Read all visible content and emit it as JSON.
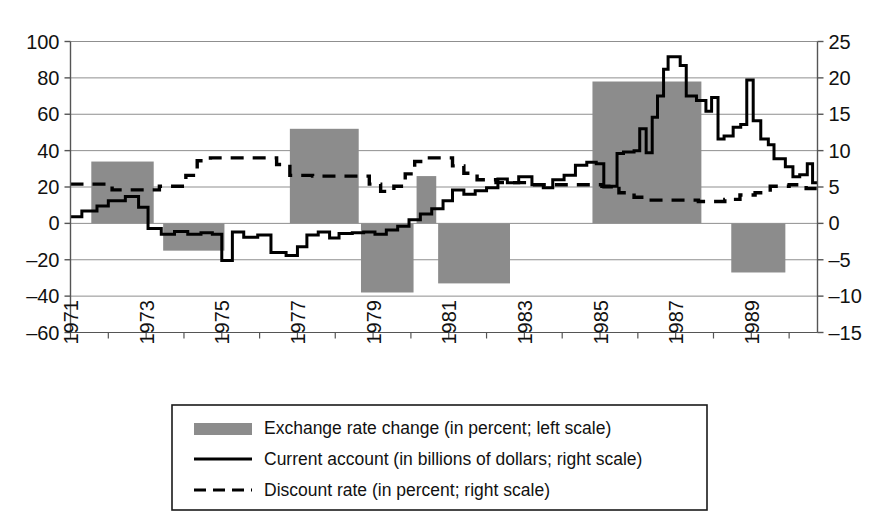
{
  "chart_data": {
    "type": "bar",
    "title": "",
    "xlabel": "",
    "ylabel_left": "",
    "ylabel_right": "",
    "grid": true,
    "legend_position": "bottom",
    "x_range": [
      1971,
      1990.75
    ],
    "x_tick_labels": [
      "1971",
      "1973",
      "1975",
      "1977",
      "1979",
      "1981",
      "1983",
      "1985",
      "1987",
      "1989"
    ],
    "x_tick_values": [
      1971,
      1973,
      1975,
      1977,
      1979,
      1981,
      1983,
      1985,
      1987,
      1989
    ],
    "left_axis": {
      "label": "percent",
      "ylim": [
        -60,
        100
      ],
      "ticks": [
        -60,
        -40,
        -20,
        0,
        20,
        40,
        60,
        80,
        100
      ],
      "tick_labels": [
        "–60",
        "–40",
        "–20",
        "0",
        "20",
        "40",
        "60",
        "80",
        "100"
      ]
    },
    "right_axis": {
      "label": "billions of dollars / percent",
      "ylim": [
        -15,
        25
      ],
      "ticks": [
        -15,
        -10,
        -5,
        0,
        5,
        10,
        15,
        20,
        25
      ],
      "tick_labels": [
        "–15",
        "–10",
        "–5",
        "0",
        "5",
        "10",
        "15",
        "20",
        "25"
      ]
    },
    "series": [
      {
        "name": "Exchange rate change (in percent; left scale)",
        "type": "bar",
        "axis": "left",
        "color": "#8c8c8c",
        "bars": [
          {
            "x_start": 1971.55,
            "x_end": 1973.2,
            "value": 34
          },
          {
            "x_start": 1973.45,
            "x_end": 1975.07,
            "value": -15
          },
          {
            "x_start": 1976.8,
            "x_end": 1978.62,
            "value": 52
          },
          {
            "x_start": 1978.68,
            "x_end": 1980.07,
            "value": -38
          },
          {
            "x_start": 1980.15,
            "x_end": 1980.67,
            "value": 26
          },
          {
            "x_start": 1980.72,
            "x_end": 1982.62,
            "value": -33
          },
          {
            "x_start": 1984.8,
            "x_end": 1987.68,
            "value": 78
          },
          {
            "x_start": 1988.47,
            "x_end": 1989.9,
            "value": -27
          }
        ]
      },
      {
        "name": "Current account (in billions of dollars; right scale)",
        "type": "line",
        "axis": "right",
        "style": "solid",
        "color": "#000000",
        "points": [
          [
            1971.0,
            0.9
          ],
          [
            1971.3,
            0.9
          ],
          [
            1971.3,
            1.7
          ],
          [
            1971.7,
            1.7
          ],
          [
            1971.7,
            2.4
          ],
          [
            1972.0,
            2.4
          ],
          [
            1972.0,
            3.1
          ],
          [
            1972.45,
            3.1
          ],
          [
            1972.45,
            3.7
          ],
          [
            1972.8,
            3.7
          ],
          [
            1972.8,
            2.2
          ],
          [
            1973.05,
            2.2
          ],
          [
            1973.05,
            -0.7
          ],
          [
            1973.4,
            -0.7
          ],
          [
            1973.4,
            -1.5
          ],
          [
            1973.75,
            -1.5
          ],
          [
            1973.75,
            -1.1
          ],
          [
            1974.1,
            -1.1
          ],
          [
            1974.1,
            -1.5
          ],
          [
            1974.45,
            -1.5
          ],
          [
            1974.45,
            -1.3
          ],
          [
            1974.75,
            -1.3
          ],
          [
            1974.75,
            -1.5
          ],
          [
            1975.0,
            -1.5
          ],
          [
            1975.0,
            -5.1
          ],
          [
            1975.28,
            -5.1
          ],
          [
            1975.28,
            -1.2
          ],
          [
            1975.58,
            -1.2
          ],
          [
            1975.58,
            -1.9
          ],
          [
            1975.95,
            -1.9
          ],
          [
            1975.95,
            -1.6
          ],
          [
            1976.3,
            -1.6
          ],
          [
            1976.3,
            -4.0
          ],
          [
            1976.7,
            -4.0
          ],
          [
            1976.7,
            -4.4
          ],
          [
            1977.0,
            -4.4
          ],
          [
            1977.0,
            -3.2
          ],
          [
            1977.25,
            -3.2
          ],
          [
            1977.25,
            -1.6
          ],
          [
            1977.55,
            -1.6
          ],
          [
            1977.55,
            -1.2
          ],
          [
            1977.85,
            -1.2
          ],
          [
            1977.85,
            -2.0
          ],
          [
            1978.1,
            -2.0
          ],
          [
            1978.1,
            -1.4
          ],
          [
            1978.45,
            -1.4
          ],
          [
            1978.45,
            -1.3
          ],
          [
            1978.75,
            -1.3
          ],
          [
            1978.75,
            -1.2
          ],
          [
            1979.05,
            -1.2
          ],
          [
            1979.05,
            -1.5
          ],
          [
            1979.35,
            -1.5
          ],
          [
            1979.35,
            -0.9
          ],
          [
            1979.65,
            -0.9
          ],
          [
            1979.65,
            -0.4
          ],
          [
            1979.95,
            -0.4
          ],
          [
            1979.95,
            0.5
          ],
          [
            1980.25,
            0.5
          ],
          [
            1980.25,
            1.3
          ],
          [
            1980.55,
            1.3
          ],
          [
            1980.55,
            2.0
          ],
          [
            1980.85,
            2.0
          ],
          [
            1980.85,
            3.1
          ],
          [
            1981.1,
            3.1
          ],
          [
            1981.1,
            4.6
          ],
          [
            1981.4,
            4.6
          ],
          [
            1981.4,
            4.0
          ],
          [
            1981.7,
            4.0
          ],
          [
            1981.7,
            4.5
          ],
          [
            1982.0,
            4.5
          ],
          [
            1982.0,
            4.9
          ],
          [
            1982.3,
            4.9
          ],
          [
            1982.3,
            6.1
          ],
          [
            1982.55,
            6.1
          ],
          [
            1982.55,
            5.6
          ],
          [
            1982.85,
            5.6
          ],
          [
            1982.85,
            6.4
          ],
          [
            1983.2,
            6.4
          ],
          [
            1983.2,
            5.3
          ],
          [
            1983.5,
            5.3
          ],
          [
            1983.5,
            4.9
          ],
          [
            1983.75,
            4.9
          ],
          [
            1983.75,
            6.0
          ],
          [
            1984.05,
            6.0
          ],
          [
            1984.05,
            6.6
          ],
          [
            1984.35,
            6.6
          ],
          [
            1984.35,
            8.0
          ],
          [
            1984.65,
            8.0
          ],
          [
            1984.65,
            8.4
          ],
          [
            1984.9,
            8.4
          ],
          [
            1984.9,
            8.2
          ],
          [
            1985.1,
            8.2
          ],
          [
            1985.1,
            5.0
          ],
          [
            1985.3,
            5.0
          ],
          [
            1985.3,
            5.1
          ],
          [
            1985.45,
            5.1
          ],
          [
            1985.45,
            9.6
          ],
          [
            1985.62,
            9.6
          ],
          [
            1985.62,
            9.8
          ],
          [
            1985.9,
            9.8
          ],
          [
            1985.9,
            10.0
          ],
          [
            1986.05,
            10.0
          ],
          [
            1986.05,
            13.0
          ],
          [
            1986.22,
            13.0
          ],
          [
            1986.22,
            9.7
          ],
          [
            1986.38,
            9.7
          ],
          [
            1986.38,
            14.6
          ],
          [
            1986.52,
            14.6
          ],
          [
            1986.52,
            17.5
          ],
          [
            1986.68,
            17.5
          ],
          [
            1986.68,
            21.2
          ],
          [
            1986.8,
            21.2
          ],
          [
            1986.8,
            22.9
          ],
          [
            1987.12,
            22.9
          ],
          [
            1987.12,
            21.7
          ],
          [
            1987.28,
            21.7
          ],
          [
            1987.28,
            17.5
          ],
          [
            1987.55,
            17.5
          ],
          [
            1987.55,
            16.9
          ],
          [
            1987.8,
            16.9
          ],
          [
            1987.8,
            15.4
          ],
          [
            1987.95,
            15.4
          ],
          [
            1987.95,
            17.3
          ],
          [
            1988.12,
            17.3
          ],
          [
            1988.12,
            11.6
          ],
          [
            1988.28,
            11.6
          ],
          [
            1988.28,
            12.0
          ],
          [
            1988.52,
            12.0
          ],
          [
            1988.52,
            13.2
          ],
          [
            1988.72,
            13.2
          ],
          [
            1988.72,
            13.6
          ],
          [
            1988.88,
            13.6
          ],
          [
            1988.88,
            19.7
          ],
          [
            1989.05,
            19.7
          ],
          [
            1989.05,
            14.1
          ],
          [
            1989.25,
            14.1
          ],
          [
            1989.25,
            11.6
          ],
          [
            1989.45,
            11.6
          ],
          [
            1989.45,
            10.8
          ],
          [
            1989.6,
            10.8
          ],
          [
            1989.6,
            8.9
          ],
          [
            1989.9,
            8.9
          ],
          [
            1989.9,
            7.8
          ],
          [
            1990.1,
            7.8
          ],
          [
            1990.1,
            6.4
          ],
          [
            1990.28,
            6.4
          ],
          [
            1990.28,
            6.7
          ],
          [
            1990.48,
            6.7
          ],
          [
            1990.48,
            8.2
          ],
          [
            1990.62,
            8.2
          ],
          [
            1990.62,
            5.6
          ],
          [
            1990.75,
            5.6
          ]
        ]
      },
      {
        "name": "Discount rate (in percent; right scale)",
        "type": "line",
        "axis": "right",
        "style": "dashed",
        "color": "#000000",
        "points": [
          [
            1971.0,
            5.4
          ],
          [
            1972.1,
            5.4
          ],
          [
            1972.1,
            4.6
          ],
          [
            1973.35,
            4.6
          ],
          [
            1973.35,
            5.1
          ],
          [
            1974.05,
            5.1
          ],
          [
            1974.05,
            6.6
          ],
          [
            1974.35,
            6.6
          ],
          [
            1974.35,
            8.6
          ],
          [
            1974.7,
            8.6
          ],
          [
            1974.7,
            9.0
          ],
          [
            1976.45,
            9.0
          ],
          [
            1976.45,
            8.1
          ],
          [
            1976.8,
            8.1
          ],
          [
            1976.8,
            6.6
          ],
          [
            1977.4,
            6.6
          ],
          [
            1977.4,
            6.5
          ],
          [
            1978.9,
            6.5
          ],
          [
            1978.9,
            5.4
          ],
          [
            1979.2,
            5.4
          ],
          [
            1979.2,
            4.4
          ],
          [
            1979.55,
            4.4
          ],
          [
            1979.55,
            5.1
          ],
          [
            1979.85,
            5.1
          ],
          [
            1979.85,
            6.8
          ],
          [
            1980.1,
            6.8
          ],
          [
            1980.1,
            8.5
          ],
          [
            1980.35,
            8.5
          ],
          [
            1980.35,
            9.0
          ],
          [
            1981.1,
            9.0
          ],
          [
            1981.1,
            7.9
          ],
          [
            1981.4,
            7.9
          ],
          [
            1981.4,
            6.9
          ],
          [
            1981.75,
            6.9
          ],
          [
            1981.75,
            6.0
          ],
          [
            1982.25,
            6.0
          ],
          [
            1982.25,
            5.6
          ],
          [
            1983.0,
            5.6
          ],
          [
            1983.0,
            5.3
          ],
          [
            1985.05,
            5.3
          ],
          [
            1985.05,
            5.1
          ],
          [
            1985.5,
            5.1
          ],
          [
            1985.5,
            4.2
          ],
          [
            1985.9,
            4.2
          ],
          [
            1985.9,
            3.6
          ],
          [
            1986.25,
            3.6
          ],
          [
            1986.25,
            3.2
          ],
          [
            1987.6,
            3.2
          ],
          [
            1987.6,
            3.0
          ],
          [
            1988.3,
            3.0
          ],
          [
            1988.3,
            3.3
          ],
          [
            1988.7,
            3.3
          ],
          [
            1988.7,
            3.9
          ],
          [
            1989.1,
            3.9
          ],
          [
            1989.1,
            4.2
          ],
          [
            1989.5,
            4.2
          ],
          [
            1989.5,
            5.1
          ],
          [
            1990.0,
            5.1
          ],
          [
            1990.0,
            5.3
          ],
          [
            1990.45,
            5.3
          ],
          [
            1990.45,
            4.8
          ],
          [
            1990.75,
            4.8
          ]
        ]
      }
    ]
  },
  "legend": {
    "items": [
      {
        "marker": "swatch",
        "label": "Exchange rate change (in percent; left scale)"
      },
      {
        "marker": "solid-line",
        "label": "Current account (in billions of dollars; right scale)"
      },
      {
        "marker": "dashed-line",
        "label": "Discount rate (in percent; right scale)"
      }
    ]
  },
  "colors": {
    "bar_fill": "#8c8c8c",
    "line": "#000000",
    "grid": "#8f8f8f",
    "axis": "#555555",
    "background": "#ffffff"
  }
}
